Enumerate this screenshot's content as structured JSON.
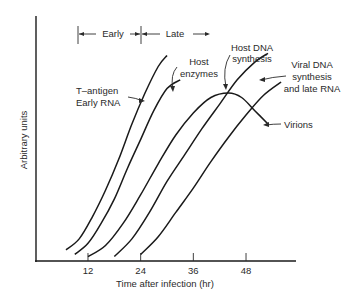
{
  "chart_data": {
    "type": "line",
    "title": "",
    "xlabel": "Time after infection (hr)",
    "ylabel": "Arbitrary units",
    "xlim": [
      0,
      58
    ],
    "ylim": [
      0,
      100
    ],
    "x_ticks": [
      12,
      24,
      36,
      48
    ],
    "grid": false,
    "phases": [
      {
        "label": "Early",
        "from": 0,
        "to": 24
      },
      {
        "label": "Late",
        "from": 24,
        "to": 30
      }
    ],
    "series": [
      {
        "name": "T-antigen Early RNA",
        "label_lines": [
          "T–antigen",
          "Early RNA"
        ],
        "points": [
          [
            7,
            5
          ],
          [
            10,
            10
          ],
          [
            13,
            20
          ],
          [
            16,
            32
          ],
          [
            19,
            46
          ],
          [
            22,
            62
          ],
          [
            25,
            76
          ],
          [
            28,
            88
          ],
          [
            30,
            93
          ]
        ]
      },
      {
        "name": "Host enzymes",
        "label_lines": [
          "Host",
          "enzymes"
        ],
        "points": [
          [
            9,
            3
          ],
          [
            12,
            8
          ],
          [
            15,
            17
          ],
          [
            18,
            28
          ],
          [
            21,
            42
          ],
          [
            24,
            55
          ],
          [
            27,
            68
          ],
          [
            30,
            78
          ],
          [
            33,
            82
          ]
        ]
      },
      {
        "name": "Host DNA synthesis",
        "label_lines": [
          "Host DNA",
          "synthesis"
        ],
        "points": [
          [
            12,
            2
          ],
          [
            16,
            7
          ],
          [
            20,
            17
          ],
          [
            24,
            30
          ],
          [
            28,
            44
          ],
          [
            32,
            57
          ],
          [
            36,
            67
          ],
          [
            40,
            74
          ],
          [
            44,
            76
          ],
          [
            47,
            74
          ],
          [
            50,
            68
          ],
          [
            53,
            62
          ]
        ]
      },
      {
        "name": "Viral DNA synthesis and late RNA",
        "label_lines": [
          "Viral DNA",
          "synthesis",
          "and late RNA"
        ],
        "points": [
          [
            18,
            2
          ],
          [
            22,
            10
          ],
          [
            26,
            22
          ],
          [
            30,
            36
          ],
          [
            34,
            48
          ],
          [
            38,
            60
          ],
          [
            42,
            71
          ],
          [
            46,
            82
          ],
          [
            50,
            90
          ],
          [
            53,
            94
          ]
        ]
      },
      {
        "name": "Virions",
        "label_lines": [
          "Virions"
        ],
        "points": [
          [
            24,
            3
          ],
          [
            28,
            11
          ],
          [
            32,
            22
          ],
          [
            36,
            33
          ],
          [
            40,
            45
          ],
          [
            44,
            56
          ],
          [
            48,
            66
          ],
          [
            52,
            75
          ],
          [
            56,
            81
          ]
        ]
      }
    ]
  }
}
